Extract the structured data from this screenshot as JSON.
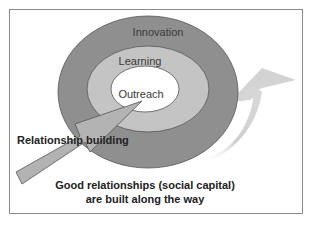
{
  "diagram": {
    "rings": [
      {
        "id": "outer",
        "label": "Innovation",
        "color": "#8f8f8f"
      },
      {
        "id": "middle",
        "label": "Learning",
        "color": "#c4c4c4"
      },
      {
        "id": "inner",
        "label": "Outreach",
        "color": "#ffffff"
      }
    ],
    "arrow_label": "Relationship building",
    "arrow_color": "#b3b3b3",
    "curved_arrow_color": "#d2d2d2",
    "caption_line1": "Good relationships (social capital)",
    "caption_line2": "are built along the way"
  }
}
